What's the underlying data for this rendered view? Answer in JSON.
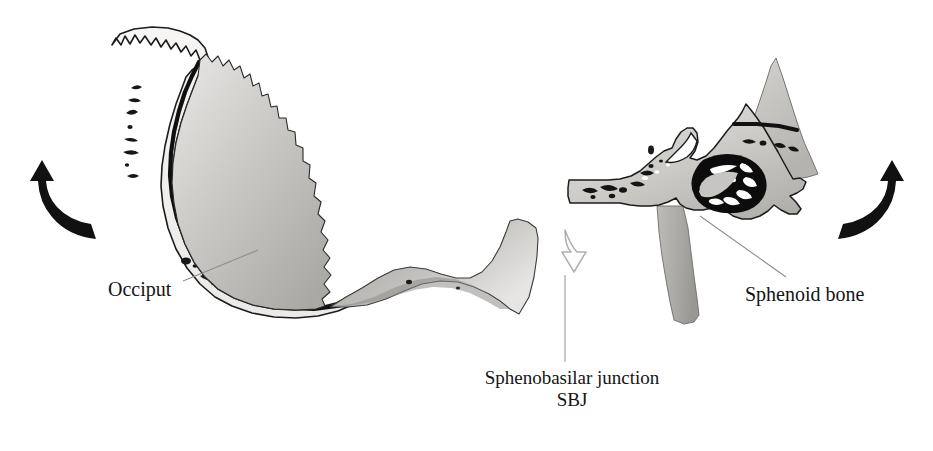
{
  "figure": {
    "background_color": "#ffffff",
    "width": 933,
    "height": 451
  },
  "labels": {
    "occiput": "Occiput",
    "sphenoid": "Sphenoid bone",
    "sbj_line1": "Sphenobasilar junction",
    "sbj_line2": "SBJ"
  },
  "icons": {
    "left_rotation_arrow": "curved-arrow-up-left-icon",
    "right_rotation_arrow": "curved-arrow-up-right-icon",
    "sbj_pointer_arrow": "hollow-arrow-down-icon",
    "occiput_leader": "leader-line-icon",
    "sphenoid_leader": "leader-line-icon"
  },
  "structures": {
    "occiput": {
      "name": "Occiput",
      "parts": [
        "lambdoid suture serrated edge",
        "outer table and diploe band",
        "inner table dark line",
        "squamous body",
        "basilar part"
      ]
    },
    "sphenoid": {
      "name": "Sphenoid bone",
      "parts": [
        "greater wing",
        "anterior clinoid process",
        "sella turcica",
        "sphenoid sinus",
        "body",
        "pterygoid process"
      ]
    }
  },
  "colors": {
    "ink": "#141414",
    "outline": "#1a1a1a",
    "bone_light": "#f0efed",
    "bone_mid": "#cfcecb",
    "bone_gray": "#b9b8b5",
    "bone_dark": "#9e9d9a",
    "cavity": "#0d0d0d",
    "leader": "#8e8e8e",
    "hollow_arrow_stroke": "#b2b2b2"
  }
}
